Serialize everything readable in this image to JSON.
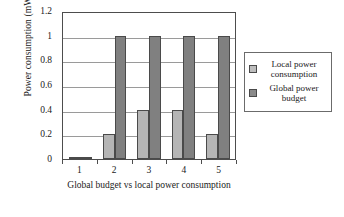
{
  "chart_data": {
    "type": "bar",
    "title": "",
    "categories": [
      "1",
      "2",
      "3",
      "4",
      "5"
    ],
    "series": [
      {
        "name": "Local power consumption",
        "color": "#b5b5b5",
        "values": [
          0.01,
          0.2,
          0.4,
          0.4,
          0.2
        ]
      },
      {
        "name": "Global power budget",
        "color": "#808080",
        "values": [
          0.01,
          1,
          1,
          1,
          1
        ]
      }
    ],
    "xlabel": "Global budget vs local power consumption",
    "ylabel": "Power consumption (mW)",
    "ylim": [
      0,
      1.2
    ],
    "yticks": [
      0,
      0.2,
      0.4,
      0.6,
      0.8,
      1,
      1.2
    ],
    "ytick_labels": [
      "0",
      "0.2",
      "0.4",
      "0.6",
      "0.8",
      "1",
      "1.2"
    ],
    "grid": "horizontal",
    "legend_position": "right"
  },
  "legend": {
    "items": [
      {
        "label": "Local power consumption",
        "swatch": "light-gray-swatch-icon"
      },
      {
        "label": "Global power budget",
        "swatch": "dark-gray-swatch-icon"
      }
    ]
  }
}
